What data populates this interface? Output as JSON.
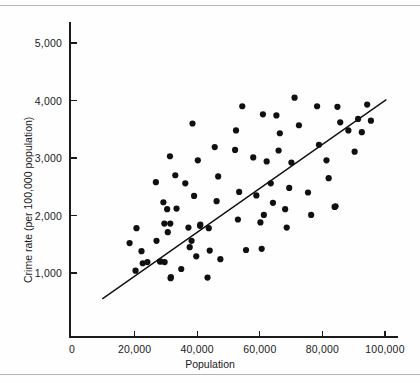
{
  "chart_data": {
    "type": "scatter",
    "title": "",
    "xlabel": "Population",
    "ylabel": "Crime rate (per 100,000 population)",
    "xlim": [
      0,
      104000
    ],
    "ylim": [
      0,
      5400
    ],
    "grid": false,
    "legend": null,
    "xticks": [
      0,
      20000,
      40000,
      60000,
      80000,
      100000
    ],
    "xtick_labels": [
      "0",
      "20,000",
      "40,000",
      "60,000",
      "80,000",
      "100,000"
    ],
    "yticks": [
      1000,
      2000,
      3000,
      4000,
      5000
    ],
    "ytick_labels": [
      "1,000",
      "2,000",
      "3,000",
      "4,000",
      "5,000"
    ],
    "marker": "filled-circle",
    "marker_color": "#101010",
    "marker_size_px": 3.1,
    "trendline": {
      "type": "linear-fit",
      "color": "#111111",
      "x_start": 9800,
      "y_start": 555,
      "x_end": 100300,
      "y_end": 4010,
      "slope_per_1000_pop": 38.2,
      "intercept": 181
    },
    "n_points": 86,
    "points": [
      [
        18400,
        1520
      ],
      [
        20300,
        1040
      ],
      [
        20600,
        1780
      ],
      [
        22200,
        1380
      ],
      [
        22600,
        1170
      ],
      [
        24100,
        1190
      ],
      [
        26800,
        2580
      ],
      [
        27000,
        1560
      ],
      [
        28100,
        1200
      ],
      [
        28400,
        1200
      ],
      [
        29200,
        2230
      ],
      [
        29500,
        1860
      ],
      [
        29600,
        1190
      ],
      [
        30400,
        2110
      ],
      [
        30600,
        1710
      ],
      [
        31300,
        3030
      ],
      [
        31400,
        1860
      ],
      [
        31500,
        910
      ],
      [
        31600,
        930
      ],
      [
        33000,
        2700
      ],
      [
        33400,
        2120
      ],
      [
        34900,
        1070
      ],
      [
        36200,
        2560
      ],
      [
        37200,
        1790
      ],
      [
        37600,
        1450
      ],
      [
        38200,
        1560
      ],
      [
        38500,
        3600
      ],
      [
        39000,
        2340
      ],
      [
        39700,
        1290
      ],
      [
        40200,
        2960
      ],
      [
        40900,
        1820
      ],
      [
        41000,
        1840
      ],
      [
        43300,
        920
      ],
      [
        43700,
        1780
      ],
      [
        44000,
        1390
      ],
      [
        45600,
        3190
      ],
      [
        46200,
        2250
      ],
      [
        46700,
        2680
      ],
      [
        47400,
        1240
      ],
      [
        52100,
        3140
      ],
      [
        52400,
        3480
      ],
      [
        53000,
        1930
      ],
      [
        53400,
        2410
      ],
      [
        54400,
        3900
      ],
      [
        55600,
        1400
      ],
      [
        57900,
        3010
      ],
      [
        58900,
        2350
      ],
      [
        60200,
        1880
      ],
      [
        60600,
        1420
      ],
      [
        61000,
        3760
      ],
      [
        61300,
        2010
      ],
      [
        62200,
        2940
      ],
      [
        63500,
        2560
      ],
      [
        64200,
        2220
      ],
      [
        65300,
        3740
      ],
      [
        66000,
        3130
      ],
      [
        66400,
        3430
      ],
      [
        68100,
        2110
      ],
      [
        68600,
        1790
      ],
      [
        69400,
        2480
      ],
      [
        70100,
        2920
      ],
      [
        71100,
        4050
      ],
      [
        72500,
        3570
      ],
      [
        75400,
        2400
      ],
      [
        76400,
        2010
      ],
      [
        78300,
        3900
      ],
      [
        78900,
        3230
      ],
      [
        81300,
        2960
      ],
      [
        82000,
        2650
      ],
      [
        83900,
        2150
      ],
      [
        84200,
        2160
      ],
      [
        84800,
        3890
      ],
      [
        85700,
        3620
      ],
      [
        88300,
        3480
      ],
      [
        90300,
        3110
      ],
      [
        91400,
        3680
      ],
      [
        92600,
        3450
      ],
      [
        94300,
        3930
      ],
      [
        95500,
        3650
      ]
    ]
  },
  "figure": {
    "background_color": "#ffffff",
    "axis_color": "#1a1a1a",
    "rule_color": "#b4b4b4"
  }
}
